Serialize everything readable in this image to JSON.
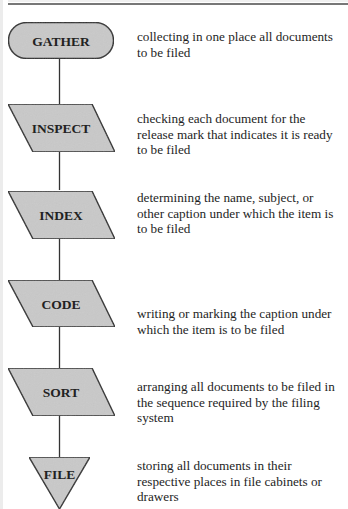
{
  "diagram": {
    "type": "flowchart",
    "title": "",
    "colors": {
      "shape_fill": "#c8c8c8",
      "shape_stroke": "#2a2a2a",
      "connector": "#333333",
      "text": "#1e1e1e"
    },
    "steps": [
      {
        "label": "GATHER",
        "shape": "terminator",
        "description": "collecting in one place all documents to be filed"
      },
      {
        "label": "INSPECT",
        "shape": "parallelogram",
        "description": "checking each document for the release mark that indicates it is ready to be filed"
      },
      {
        "label": "INDEX",
        "shape": "parallelogram",
        "description": "determining the name, subject, or other caption under which the item is to be filed"
      },
      {
        "label": "CODE",
        "shape": "parallelogram",
        "description": "writing or marking the caption under which the item is to be filed"
      },
      {
        "label": "SORT",
        "shape": "parallelogram",
        "description": "arranging all documents to be filed in the sequence required by the filing system"
      },
      {
        "label": "FILE",
        "shape": "merge-triangle",
        "description": "storing all documents in their respective places in file cabinets or drawers"
      }
    ],
    "connections": [
      {
        "from": "GATHER",
        "to": "INSPECT"
      },
      {
        "from": "INSPECT",
        "to": "INDEX"
      },
      {
        "from": "INDEX",
        "to": "CODE"
      },
      {
        "from": "CODE",
        "to": "SORT"
      },
      {
        "from": "SORT",
        "to": "FILE"
      }
    ]
  }
}
